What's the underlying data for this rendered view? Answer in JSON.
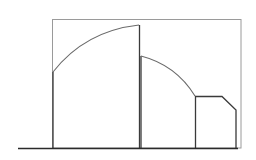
{
  "diagram": {
    "type": "line-drawing",
    "colors": {
      "background": "#ffffff",
      "frame": "#9a9a9a",
      "ink": "#3a3a3a",
      "arc": "#6a6a6a",
      "baseline": "#2a2a2a"
    },
    "frame": {
      "x1": 52,
      "y1": 19,
      "x2": 241,
      "y2": 148
    },
    "baseline": {
      "x1": 18,
      "x2": 241,
      "y": 148
    },
    "segments": [
      {
        "name": "segment-1",
        "left_x": 53,
        "right_x": 140,
        "top_profile": "rising-arc",
        "arc_start": [
          53,
          72
        ],
        "arc_end": [
          139,
          25
        ]
      },
      {
        "name": "segment-2",
        "left_x": 140,
        "right_x": 195,
        "top_profile": "falling-arc",
        "arc_start": [
          141,
          56
        ],
        "arc_end": [
          195,
          96
        ]
      },
      {
        "name": "segment-3",
        "left_x": 195,
        "right_x": 236,
        "top_profile": "flat-with-chamfer",
        "top_y": 96,
        "chamfer_start": [
          222,
          96
        ],
        "chamfer_end": [
          236,
          110
        ]
      }
    ]
  }
}
